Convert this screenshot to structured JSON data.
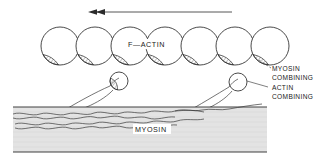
{
  "figure": {
    "title_label": "F—ACTIN",
    "filament_label": "MYOSIN",
    "direction_arrow": {
      "name": "movement-direction-arrow",
      "direction": "left",
      "x_start": 232,
      "x_end": 88,
      "y": 12
    },
    "callouts": [
      {
        "line": "MYOSIN"
      },
      {
        "line": "COMBINING"
      },
      {
        "line": "ACTIN"
      },
      {
        "line": "COMBINING"
      }
    ],
    "actin_monomers": {
      "count": 7,
      "radius": 19,
      "center_y": 46,
      "centers_x": [
        60,
        95,
        130,
        165,
        200,
        235,
        270
      ],
      "site_position": "lower-left",
      "site_fill": "hatched"
    },
    "myosin_heads": [
      {
        "name": "myosin-head-left",
        "tip_x": 118,
        "tip_y": 81,
        "tip_r": 9,
        "tip_fill": "hatched",
        "base_x": 60,
        "base_y": 113
      },
      {
        "name": "myosin-head-right",
        "tip_x": 237,
        "tip_y": 82,
        "tip_r": 9,
        "tip_fill": "plain",
        "base_x": 183,
        "base_y": 114
      }
    ],
    "myosin_filament": {
      "x_left": 13,
      "x_right": 267,
      "y_top": 107,
      "y_bottom": 152,
      "fill_color": "#e3e3e3",
      "coil_strands": 2
    },
    "colors": {
      "ink": "#2b2b2b",
      "paper": "#ffffff",
      "filament_gray": "#e3e3e3",
      "hatch": "#2b2b2b"
    }
  }
}
